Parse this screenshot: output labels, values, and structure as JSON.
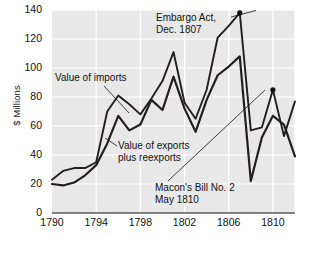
{
  "chart_data": {
    "type": "line",
    "title": "",
    "xlabel": "",
    "ylabel": "$ Millions",
    "xlim": [
      1790,
      1812
    ],
    "ylim": [
      0,
      140
    ],
    "xticks": [
      1790,
      1794,
      1798,
      1802,
      1806,
      1810
    ],
    "yticks": [
      0,
      20,
      40,
      60,
      80,
      100,
      120,
      140
    ],
    "grid": true,
    "legend_position": "inline-annotations",
    "x": [
      1790,
      1791,
      1792,
      1793,
      1794,
      1795,
      1796,
      1797,
      1798,
      1799,
      1800,
      1801,
      1802,
      1803,
      1804,
      1805,
      1806,
      1807,
      1808,
      1809,
      1810,
      1811,
      1812
    ],
    "series": [
      {
        "name": "Value of imports",
        "values": [
          23,
          29,
          31,
          31,
          35,
          70,
          81,
          75,
          68,
          79,
          91,
          111,
          76,
          65,
          85,
          121,
          129,
          138,
          57,
          59,
          85,
          53,
          77
        ]
      },
      {
        "name": "Value of exports plus reexports",
        "values": [
          20,
          19,
          21,
          26,
          33,
          48,
          67,
          57,
          61,
          78,
          71,
          94,
          72,
          56,
          78,
          95,
          101,
          108,
          22,
          52,
          67,
          61,
          39
        ]
      }
    ],
    "annotations": [
      {
        "name": "embargo-act",
        "line1": "Embargo Act,",
        "line2": "Dec. 1807",
        "point_x": 1807,
        "point_y": 138
      },
      {
        "name": "value-of-imports",
        "line1": "Value of imports",
        "line2": ""
      },
      {
        "name": "value-of-exports",
        "line1": "Value of exports",
        "line2": "plus reexports"
      },
      {
        "name": "macons-bill-no-2",
        "line1": "Macon's Bill No. 2",
        "line2": "May 1810",
        "point_x": 1810,
        "point_y": 85
      }
    ],
    "colors": {
      "plot_background": "#e8e8e8",
      "grid": "#ffffff",
      "line": "#231f20",
      "text": "#111111",
      "figure_background": "#ffffff"
    }
  }
}
